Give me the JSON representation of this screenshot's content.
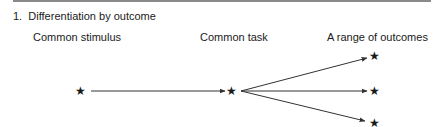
{
  "heading": {
    "number": "1.",
    "title": "Differentiation by outcome"
  },
  "columns": [
    {
      "label": "Common stimulus"
    },
    {
      "label": "Common task"
    },
    {
      "label": "A range of outcomes"
    }
  ],
  "nodes": {
    "stimulus_symbol": "★",
    "task_symbol": "★",
    "outcome_symbols": [
      "★",
      "★",
      "★"
    ]
  },
  "colors": {
    "line": "#333333",
    "rule": "#8a8a8a"
  }
}
